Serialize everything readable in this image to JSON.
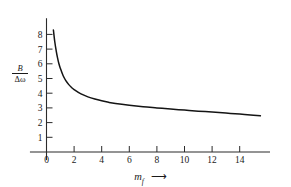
{
  "chart_data": {
    "type": "line",
    "title": "",
    "xlabel": "m_f",
    "xlabel_symbol": "m",
    "xlabel_subscript": "f",
    "xlabel_arrow": "⟶",
    "ylabel": "B/Δω",
    "ylabel_numerator": "B",
    "ylabel_denominator": "Δω",
    "xlim": [
      -1.2,
      16.2
    ],
    "ylim": [
      0,
      9.1
    ],
    "xticks": [
      0,
      2,
      4,
      6,
      8,
      10,
      12,
      14
    ],
    "xtick_labels": [
      "0",
      "2",
      "4",
      "6",
      "8",
      "10",
      "12",
      "14"
    ],
    "yticks": [
      1,
      2,
      3,
      4,
      5,
      6,
      7,
      8
    ],
    "ytick_labels": [
      "1",
      "2",
      "3",
      "4",
      "5",
      "6",
      "7",
      "8"
    ],
    "grid": false,
    "legend": false,
    "curve_color": "#141414",
    "axis_color": "#2b2b2b",
    "series": [
      {
        "name": "B/Δω vs m_f",
        "x": [
          0.5,
          0.6,
          0.7,
          0.8,
          0.9,
          1.0,
          1.2,
          1.4,
          1.6,
          1.8,
          2.0,
          2.5,
          3.0,
          3.5,
          4.0,
          4.5,
          5.0,
          6.0,
          7.0,
          8.0,
          9.0,
          10.0,
          11.0,
          12.0,
          13.0,
          14.0,
          15.0,
          15.5
        ],
        "y": [
          8.3,
          7.5,
          6.9,
          6.4,
          6.0,
          5.7,
          5.2,
          4.85,
          4.6,
          4.4,
          4.25,
          3.95,
          3.75,
          3.6,
          3.48,
          3.38,
          3.3,
          3.18,
          3.08,
          3.0,
          2.92,
          2.85,
          2.78,
          2.72,
          2.65,
          2.58,
          2.5,
          2.46
        ]
      }
    ]
  },
  "axis_geometry": {
    "x_origin_px": 46.5,
    "y_baseline_px": 152,
    "px_per_x_unit": 13.8,
    "px_per_y_unit": 14.7,
    "y_value_at_baseline": 0
  }
}
